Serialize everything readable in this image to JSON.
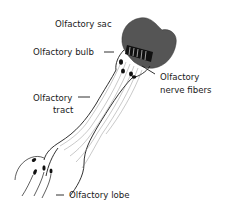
{
  "diagram": {
    "labels": {
      "olfactory_sac": "Olfactory sac",
      "olfactory_bulb": "Olfactory bulb",
      "olfactory_nerve_fibers_line1": "Olfactory",
      "olfactory_nerve_fibers_line2": "nerve fibers",
      "olfactory_tract_line1": "Olfactory",
      "olfactory_tract_line2": "tract",
      "olfactory_lobe": "Olfactory lobe"
    },
    "colors": {
      "sac_fill": "#555555",
      "stroke": "#1a1a1a",
      "background": "#ffffff"
    }
  }
}
